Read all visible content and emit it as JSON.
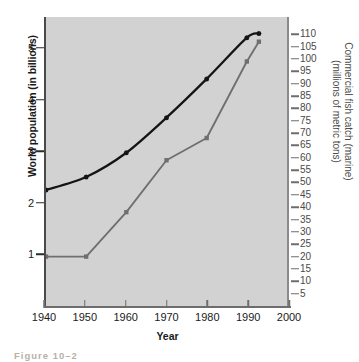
{
  "chart_data": {
    "type": "line",
    "title": "",
    "xlabel": "Year",
    "ylabel": "World population (in billions)",
    "y2label_line1": "Commercial fish catch (marine)",
    "y2label_line2": "(millions of metric tons)",
    "grid": false,
    "legend": "none",
    "xlim": [
      1940,
      2000
    ],
    "ylim": [
      0,
      5.6
    ],
    "y2lim": [
      0,
      117
    ],
    "x_ticks": [
      "1940",
      "1950",
      "1960",
      "1970",
      "1980",
      "1990",
      "2000"
    ],
    "x_tick_values": [
      1940,
      1950,
      1960,
      1970,
      1980,
      1990,
      2000
    ],
    "y_ticks": [
      "1",
      "2",
      "3",
      "4",
      "5"
    ],
    "y_tick_values": [
      1,
      2,
      3,
      4,
      5
    ],
    "y2_ticks": [
      "110",
      "105",
      "100",
      "95",
      "90",
      "85",
      "80",
      "75",
      "70",
      "65",
      "60",
      "55",
      "50",
      "45",
      "40",
      "35",
      "30",
      "25",
      "20",
      "15",
      "10",
      "5"
    ],
    "y2_tick_values": [
      110,
      105,
      100,
      95,
      90,
      85,
      80,
      75,
      70,
      65,
      60,
      55,
      50,
      45,
      40,
      35,
      30,
      25,
      20,
      15,
      10,
      5
    ],
    "series": [
      {
        "name": "World population",
        "axis": "left",
        "color": "#141414",
        "marker": "circle",
        "x": [
          1940,
          1950,
          1960,
          1970,
          1980,
          1990,
          1993
        ],
        "values": [
          2.25,
          2.5,
          2.97,
          3.65,
          4.4,
          5.2,
          5.28
        ]
      },
      {
        "name": "Commercial fish catch (marine)",
        "axis": "right",
        "color": "#6f6f6f",
        "marker": "square",
        "x": [
          1940,
          1950,
          1960,
          1970,
          1980,
          1990,
          1993
        ],
        "values": [
          20,
          20,
          38,
          59,
          68,
          99,
          107
        ]
      }
    ]
  },
  "figure": {
    "caption": "Figure 10–2",
    "plot_background": "#d2d2d2",
    "page_background": "#ffffff"
  }
}
